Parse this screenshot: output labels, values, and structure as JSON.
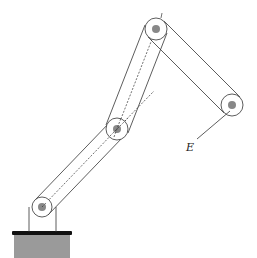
{
  "diagram": {
    "type": "robotic-arm-schematic",
    "colors": {
      "stroke": "#333333",
      "joint_fill": "#ffffff",
      "pin_fill": "#888888",
      "base_fill": "#9a9a9a",
      "base_top": "#111111"
    },
    "joints": [
      {
        "name": "base-joint",
        "cx": 42,
        "cy": 207,
        "r_outer": 10,
        "r_inner": 4
      },
      {
        "name": "elbow-joint",
        "cx": 117,
        "cy": 129,
        "r_outer": 11,
        "r_inner": 4
      },
      {
        "name": "top-joint",
        "cx": 156,
        "cy": 29,
        "r_outer": 11,
        "r_inner": 4
      },
      {
        "name": "end-joint",
        "cx": 232,
        "cy": 105,
        "r_outer": 11,
        "r_inner": 4
      }
    ],
    "labels": {
      "end_effector": "E"
    }
  }
}
